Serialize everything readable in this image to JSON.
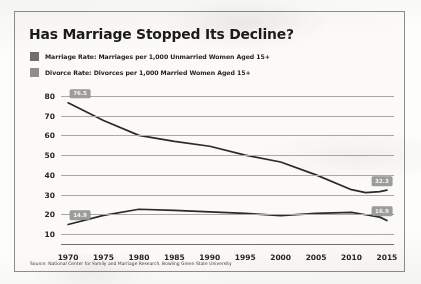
{
  "figure": {
    "title": "Has Marriage Stopped Its Decline?",
    "source": "Source: National Center for Family and Marriage Research, Bowling Green State University",
    "marriage_color": "#6e6e6a",
    "divorce_color": "#8e8e8a",
    "line_color": "#2a2a28",
    "grid_color": "#a9a9a5",
    "chip_color": "#9c9c98"
  },
  "legend": {
    "items": [
      {
        "label": "Marriage Rate: Marriages per 1,000 Unmarried Women Aged 15+",
        "swatch": "#6e6e6a"
      },
      {
        "label": "Divorce Rate: Divorces per 1,000 Married Women Aged 15+",
        "swatch": "#8e8e8a"
      }
    ]
  },
  "chart_data": {
    "type": "line",
    "title": "Has Marriage Stopped Its Decline?",
    "xlabel": "",
    "ylabel": "",
    "xlim": [
      1969,
      2016
    ],
    "ylim": [
      5,
      85
    ],
    "grid": true,
    "legend_position": "top-left",
    "y_ticks": [
      10,
      20,
      30,
      40,
      50,
      60,
      70,
      80
    ],
    "x_ticks": [
      1970,
      1975,
      1980,
      1985,
      1990,
      1995,
      2000,
      2005,
      2010,
      2015
    ],
    "x": [
      1970,
      1975,
      1980,
      1985,
      1990,
      1995,
      2000,
      2005,
      2010,
      2012,
      2014,
      2015
    ],
    "series": [
      {
        "name": "Marriage Rate",
        "values": [
          76.5,
          67.5,
          60.0,
          57.0,
          54.5,
          50.0,
          46.5,
          40.0,
          32.5,
          31.0,
          31.5,
          32.3
        ],
        "endpoint_labels": [
          {
            "x": 1970,
            "y": 76.5,
            "text": "76.5"
          },
          {
            "x": 2015,
            "y": 32.3,
            "text": "32.3"
          }
        ]
      },
      {
        "name": "Divorce Rate",
        "values": [
          14.9,
          19.5,
          22.6,
          22.0,
          21.3,
          20.5,
          19.4,
          20.5,
          21.0,
          19.8,
          18.6,
          16.9
        ],
        "endpoint_labels": [
          {
            "x": 1970,
            "y": 14.9,
            "text": "14.9"
          },
          {
            "x": 2015,
            "y": 16.9,
            "text": "16.9"
          }
        ]
      }
    ]
  }
}
